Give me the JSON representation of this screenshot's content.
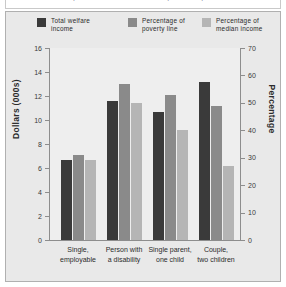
{
  "title": "welfare incomes, in 2004 constant dollars, Canada, 2004",
  "legend": {
    "items": [
      {
        "label": "Total welfare\nincome",
        "color": "#3a3a3a",
        "swatch": "legend-swatch"
      },
      {
        "label": "Percentage of\npoverty line",
        "color": "#8a8a8a",
        "swatch": "legend-swatch"
      },
      {
        "label": "Percentage of\nmedian income",
        "color": "#b5b5b5",
        "swatch": "legend-swatch"
      }
    ]
  },
  "chart_data": {
    "type": "bar",
    "title": "welfare incomes, in 2004 constant dollars, Canada, 2004",
    "categories": [
      "Single,\nemployable",
      "Person with\na disability",
      "Single parent,\none child",
      "Couple,\ntwo children"
    ],
    "series": [
      {
        "name": "Total welfare income",
        "axis": "left",
        "color": "#3a3a3a",
        "values": [
          6.7,
          11.6,
          10.7,
          13.2
        ]
      },
      {
        "name": "Percentage of poverty line",
        "axis": "right",
        "color": "#8a8a8a",
        "values": [
          31,
          57,
          53,
          49
        ]
      },
      {
        "name": "Percentage of median income",
        "axis": "right",
        "color": "#b5b5b5",
        "values": [
          29,
          50,
          40,
          27
        ]
      }
    ],
    "xlabel": "",
    "ylabel": "Dollars (000s)",
    "ylabel_right": "Percentage",
    "ylim": [
      0,
      16
    ],
    "ylim_right": [
      0,
      70
    ],
    "yticks": [
      0,
      2,
      4,
      6,
      8,
      10,
      12,
      14,
      16
    ],
    "yticks_right": [
      0,
      10,
      20,
      30,
      40,
      50,
      60,
      70
    ],
    "grid": false,
    "legend_position": "top"
  }
}
